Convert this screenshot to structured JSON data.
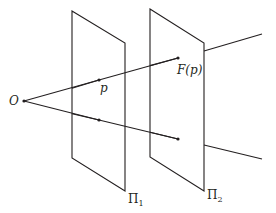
{
  "diagram": {
    "type": "projection-planes",
    "colors": {
      "stroke": "#231f20",
      "background": "#ffffff"
    },
    "labels": {
      "origin": "O",
      "point_p": "p",
      "image_point": "F(p)",
      "plane1_base": "Π",
      "plane1_sub": "1",
      "plane2_base": "Π",
      "plane2_sub": "2"
    },
    "planes": [
      {
        "name": "Π1",
        "corners": [
          [
            72,
            11
          ],
          [
            125,
            43
          ],
          [
            125,
            191
          ],
          [
            72,
            158
          ]
        ]
      },
      {
        "name": "Π2",
        "corners": [
          [
            150,
            9
          ],
          [
            204,
            43
          ],
          [
            204,
            191
          ],
          [
            150,
            157
          ]
        ]
      }
    ],
    "points": [
      {
        "name": "O",
        "x": 24,
        "y": 101
      },
      {
        "name": "p",
        "x": 99,
        "y": 80
      },
      {
        "name": "q",
        "x": 99,
        "y": 120
      },
      {
        "name": "F(p)",
        "x": 178,
        "y": 58
      },
      {
        "name": "F(q)",
        "x": 178,
        "y": 139
      }
    ],
    "rays": [
      {
        "from": "O",
        "through": [
          "p",
          "F(p)"
        ],
        "end": [
          262,
          34
        ]
      },
      {
        "from": "O",
        "through": [
          "q",
          "F(q)"
        ],
        "end": [
          262,
          159
        ]
      }
    ]
  }
}
